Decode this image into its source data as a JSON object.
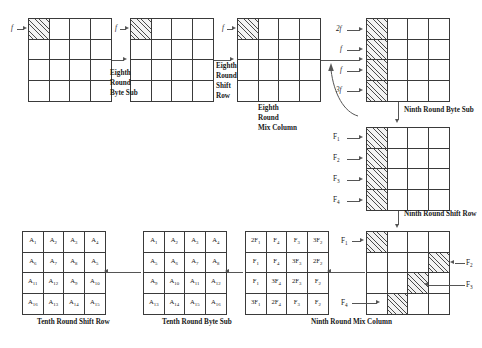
{
  "diagram": {
    "process_labels": {
      "eighth_round_byte_sub": "Eighth\nRound\nByte Sub",
      "eighth_round_shift_row": "Eighth\nRound\nShift\nRow",
      "eighth_round_mix_column": "Eighth\nRound\nMix Column",
      "ninth_round_byte_sub": "Ninth Round Byte Sub",
      "ninth_round_shift_row": "Ninth Round Shift Row",
      "ninth_round_mix_column": "Ninth Round Mix Column",
      "tenth_round_byte_sub": "Tenth Round Byte Sub",
      "tenth_round_shift_row": "Tenth Round Shift Row"
    },
    "step_words": {
      "eighth": "Eighth",
      "round": "Round",
      "byte_sub": "Byte Sub",
      "shift": "Shift",
      "row": "Row",
      "mix_column": "Mix Column"
    },
    "fault_labels": {
      "f": "f",
      "two_f": "2f",
      "three_f": "3f",
      "F1": "F",
      "F1sub": "1",
      "F2": "F",
      "F2sub": "2",
      "F3": "F",
      "F3sub": "3",
      "F4": "F",
      "F4sub": "4"
    },
    "grids": [
      {
        "name": "grid-1-eighth-round-input",
        "hatched": [
          0
        ],
        "values": [
          "",
          "",
          "",
          "",
          "",
          "",
          "",
          "",
          "",
          "",
          "",
          "",
          "",
          "",
          "",
          ""
        ]
      },
      {
        "name": "grid-2-eighth-round-byte-sub-out",
        "hatched": [
          0
        ],
        "values": [
          "",
          "",
          "",
          "",
          "",
          "",
          "",
          "",
          "",
          "",
          "",
          "",
          "",
          "",
          "",
          ""
        ]
      },
      {
        "name": "grid-3-eighth-round-shift-row-out",
        "hatched": [
          0
        ],
        "values": [
          "",
          "",
          "",
          "",
          "",
          "",
          "",
          "",
          "",
          "",
          "",
          "",
          "",
          "",
          "",
          ""
        ]
      },
      {
        "name": "grid-4-eighth-round-mix-column-out",
        "hatched": [
          0,
          4,
          8,
          12
        ],
        "values": [
          "",
          "",
          "",
          "",
          "",
          "",
          "",
          "",
          "",
          "",
          "",
          "",
          "",
          "",
          "",
          ""
        ]
      },
      {
        "name": "grid-5-ninth-round-byte-sub-out",
        "hatched": [
          0,
          4,
          8,
          12
        ],
        "values": [
          "",
          "",
          "",
          "",
          "",
          "",
          "",
          "",
          "",
          "",
          "",
          "",
          "",
          "",
          "",
          ""
        ]
      },
      {
        "name": "grid-6-ninth-round-shift-row-out",
        "hatched": [
          0,
          7,
          10,
          13
        ],
        "values": [
          "",
          "",
          "",
          "",
          "",
          "",
          "",
          "",
          "",
          "",
          "",
          "",
          "",
          "",
          "",
          ""
        ]
      }
    ],
    "mix_column_matrix": {
      "name": "grid-7-ninth-round-mix-column-out",
      "rows": [
        [
          {
            "coef": "2",
            "base": "F",
            "sub": "1"
          },
          {
            "coef": "",
            "base": "F",
            "sub": "4"
          },
          {
            "coef": "",
            "base": "F",
            "sub": "3"
          },
          {
            "coef": "3",
            "base": "F",
            "sub": "2"
          }
        ],
        [
          {
            "coef": "",
            "base": "F",
            "sub": "1"
          },
          {
            "coef": "",
            "base": "F",
            "sub": "4"
          },
          {
            "coef": "3",
            "base": "F",
            "sub": "3"
          },
          {
            "coef": "2",
            "base": "F",
            "sub": "2"
          }
        ],
        [
          {
            "coef": "",
            "base": "F",
            "sub": "1"
          },
          {
            "coef": "3",
            "base": "F",
            "sub": "4"
          },
          {
            "coef": "2",
            "base": "F",
            "sub": "3"
          },
          {
            "coef": "",
            "base": "F",
            "sub": "2"
          }
        ],
        [
          {
            "coef": "3",
            "base": "F",
            "sub": "1"
          },
          {
            "coef": "2",
            "base": "F",
            "sub": "4"
          },
          {
            "coef": "",
            "base": "F",
            "sub": "3"
          },
          {
            "coef": "",
            "base": "F",
            "sub": "2"
          }
        ]
      ]
    },
    "byte_sub_matrix": {
      "name": "grid-8-tenth-round-byte-sub-out",
      "rows": [
        [
          {
            "base": "A",
            "sub": "1"
          },
          {
            "base": "A",
            "sub": "2"
          },
          {
            "base": "A",
            "sub": "3"
          },
          {
            "base": "A",
            "sub": "4"
          }
        ],
        [
          {
            "base": "A",
            "sub": "5"
          },
          {
            "base": "A",
            "sub": "6"
          },
          {
            "base": "A",
            "sub": "7"
          },
          {
            "base": "A",
            "sub": "8"
          }
        ],
        [
          {
            "base": "A",
            "sub": "9"
          },
          {
            "base": "A",
            "sub": "10"
          },
          {
            "base": "A",
            "sub": "11"
          },
          {
            "base": "A",
            "sub": "12"
          }
        ],
        [
          {
            "base": "A",
            "sub": "13"
          },
          {
            "base": "A",
            "sub": "14"
          },
          {
            "base": "A",
            "sub": "15"
          },
          {
            "base": "A",
            "sub": "16"
          }
        ]
      ]
    },
    "shift_row_matrix": {
      "name": "grid-9-tenth-round-shift-row-out",
      "rows": [
        [
          {
            "base": "A",
            "sub": "1"
          },
          {
            "base": "A",
            "sub": "2"
          },
          {
            "base": "A",
            "sub": "3"
          },
          {
            "base": "A",
            "sub": "4"
          }
        ],
        [
          {
            "base": "A",
            "sub": "6"
          },
          {
            "base": "A",
            "sub": "7"
          },
          {
            "base": "A",
            "sub": "8"
          },
          {
            "base": "A",
            "sub": "5"
          }
        ],
        [
          {
            "base": "A",
            "sub": "11"
          },
          {
            "base": "A",
            "sub": "12"
          },
          {
            "base": "A",
            "sub": "9"
          },
          {
            "base": "A",
            "sub": "10"
          }
        ],
        [
          {
            "base": "A",
            "sub": "16"
          },
          {
            "base": "A",
            "sub": "13"
          },
          {
            "base": "A",
            "sub": "14"
          },
          {
            "base": "A",
            "sub": "15"
          }
        ]
      ]
    }
  }
}
